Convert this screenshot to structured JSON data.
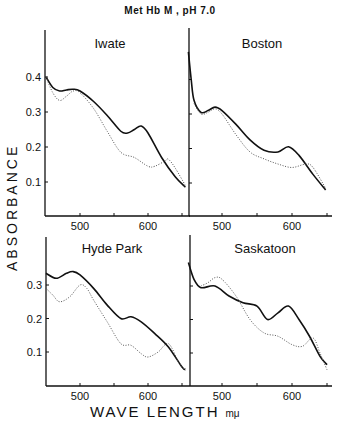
{
  "figure": {
    "title": "Met Hb M , pH 7.0",
    "ylabel": "ABSORBANCE",
    "xlabel": "WAVE LENGTH",
    "xunit": "mμ"
  },
  "chart_data": [
    {
      "type": "line",
      "title": "Iwate",
      "xlabel": "WAVE LENGTH mμ",
      "ylabel": "ABSORBANCE",
      "xlim": [
        450,
        655
      ],
      "ylim": [
        0.0,
        0.5
      ],
      "xticks": [
        500,
        600
      ],
      "xticks_minor": [
        550,
        650
      ],
      "yticks": [
        0.1,
        0.2,
        0.3,
        0.4
      ],
      "ytick_labels": [
        "0.1",
        "0.2",
        "0.3",
        "0.4"
      ],
      "series": [
        {
          "name": "solid",
          "style": "solid",
          "x": [
            450,
            460,
            470,
            480,
            490,
            500,
            520,
            540,
            560,
            570,
            580,
            590,
            600,
            620,
            640,
            655
          ],
          "values": [
            0.4,
            0.37,
            0.36,
            0.363,
            0.365,
            0.36,
            0.33,
            0.29,
            0.245,
            0.24,
            0.25,
            0.26,
            0.24,
            0.17,
            0.115,
            0.085
          ]
        },
        {
          "name": "dotted",
          "style": "dotted",
          "x": [
            450,
            460,
            470,
            480,
            490,
            500,
            520,
            540,
            560,
            580,
            600,
            610,
            625,
            630,
            640,
            655
          ],
          "values": [
            0.4,
            0.355,
            0.333,
            0.345,
            0.36,
            0.355,
            0.31,
            0.245,
            0.185,
            0.17,
            0.145,
            0.145,
            0.16,
            0.165,
            0.14,
            0.09
          ]
        }
      ]
    },
    {
      "type": "line",
      "title": "Boston",
      "xlim": [
        452,
        655
      ],
      "ylim": [
        0.0,
        0.5
      ],
      "xticks": [
        500,
        600
      ],
      "xticks_minor": [
        550,
        650
      ],
      "yticks": [
        0.1,
        0.2,
        0.3,
        0.4
      ],
      "series": [
        {
          "name": "solid",
          "style": "solid",
          "x": [
            452,
            456,
            460,
            470,
            480,
            490,
            500,
            520,
            540,
            560,
            580,
            595,
            610,
            630,
            648
          ],
          "values": [
            0.48,
            0.4,
            0.34,
            0.305,
            0.31,
            0.32,
            0.31,
            0.27,
            0.225,
            0.195,
            0.19,
            0.205,
            0.18,
            0.125,
            0.08
          ]
        },
        {
          "name": "dotted",
          "style": "dotted",
          "x": [
            460,
            470,
            480,
            490,
            500,
            520,
            540,
            560,
            580,
            600,
            620,
            630,
            648
          ],
          "values": [
            0.33,
            0.3,
            0.305,
            0.315,
            0.3,
            0.24,
            0.19,
            0.17,
            0.155,
            0.145,
            0.155,
            0.145,
            0.085
          ]
        }
      ]
    },
    {
      "type": "line",
      "title": "Hyde Park",
      "xlim": [
        450,
        655
      ],
      "ylim": [
        0.0,
        0.4
      ],
      "xticks": [
        500,
        600
      ],
      "xticks_minor": [
        550,
        650
      ],
      "yticks": [
        0.1,
        0.2,
        0.3
      ],
      "ytick_labels": [
        "0.1",
        "0.2",
        "0.3"
      ],
      "series": [
        {
          "name": "solid",
          "style": "solid",
          "x": [
            450,
            465,
            480,
            490,
            500,
            520,
            540,
            560,
            575,
            590,
            610,
            630,
            650,
            655
          ],
          "values": [
            0.335,
            0.32,
            0.335,
            0.34,
            0.33,
            0.29,
            0.24,
            0.2,
            0.205,
            0.19,
            0.155,
            0.115,
            0.055,
            0.048
          ]
        },
        {
          "name": "dotted",
          "style": "dotted",
          "x": [
            450,
            460,
            470,
            485,
            500,
            510,
            520,
            540,
            560,
            575,
            590,
            600,
            615,
            630,
            645,
            655
          ],
          "values": [
            0.29,
            0.27,
            0.25,
            0.265,
            0.3,
            0.29,
            0.255,
            0.19,
            0.125,
            0.12,
            0.095,
            0.085,
            0.1,
            0.125,
            0.07,
            0.045
          ]
        }
      ]
    },
    {
      "type": "line",
      "title": "Saskatoon",
      "xlim": [
        452,
        655
      ],
      "ylim": [
        0.0,
        0.4
      ],
      "xticks": [
        500,
        600
      ],
      "xticks_minor": [
        550,
        650
      ],
      "yticks": [
        0.1,
        0.2,
        0.3
      ],
      "series": [
        {
          "name": "solid",
          "style": "solid",
          "x": [
            452,
            460,
            470,
            490,
            510,
            530,
            550,
            565,
            580,
            595,
            610,
            625,
            640,
            650
          ],
          "values": [
            0.37,
            0.32,
            0.295,
            0.3,
            0.27,
            0.25,
            0.24,
            0.2,
            0.22,
            0.24,
            0.2,
            0.15,
            0.09,
            0.065
          ]
        },
        {
          "name": "dotted",
          "style": "dotted",
          "x": [
            470,
            480,
            490,
            500,
            520,
            540,
            560,
            580,
            600,
            615,
            630,
            640,
            650
          ],
          "values": [
            0.3,
            0.31,
            0.325,
            0.32,
            0.27,
            0.2,
            0.16,
            0.15,
            0.125,
            0.12,
            0.145,
            0.1,
            0.05
          ]
        }
      ]
    }
  ]
}
